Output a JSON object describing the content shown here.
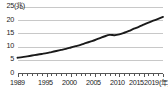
{
  "chart_data": {
    "type": "line",
    "title": "",
    "subtitle": "",
    "xlabel": "年",
    "ylabel": "兆",
    "y_unit_label": "(兆)",
    "x_unit_label": "(年)",
    "xlim": [
      1989,
      2019
    ],
    "ylim": [
      0,
      25
    ],
    "yticks": [
      0,
      5,
      10,
      15,
      20,
      25
    ],
    "ytick_labels": [
      "0",
      "5",
      "10",
      "15",
      "20",
      "25"
    ],
    "xticks": [
      1989,
      1995,
      2000,
      2005,
      2010,
      2015,
      2019
    ],
    "xtick_labels": [
      "1989",
      "1995",
      "2000",
      "2005",
      "2010",
      "2015",
      "2019"
    ],
    "grid": true,
    "grid_axis": "y",
    "legend": false,
    "legend_position": "none",
    "minor_xticks_every": 1,
    "line_color": "#1a1a1a",
    "grid_color": "#c8c8c8",
    "axis_color": "#555555",
    "background_color": "#ffffff",
    "x": [
      1989,
      1990,
      1991,
      1992,
      1993,
      1994,
      1995,
      1996,
      1997,
      1998,
      1999,
      2000,
      2001,
      2002,
      2003,
      2004,
      2005,
      2006,
      2007,
      2008,
      2009,
      2010,
      2011,
      2012,
      2013,
      2014,
      2015,
      2016,
      2017,
      2018,
      2019
    ],
    "values": [
      5.9,
      6.1,
      6.4,
      6.7,
      7.0,
      7.3,
      7.6,
      8.0,
      8.4,
      8.8,
      9.2,
      9.7,
      10.2,
      10.7,
      11.3,
      11.9,
      12.5,
      13.2,
      13.9,
      14.4,
      14.3,
      14.6,
      15.2,
      15.9,
      16.7,
      17.4,
      18.2,
      19.0,
      19.7,
      20.4,
      21.1
    ],
    "annotations": []
  },
  "y_axis": {
    "ticks": [
      {
        "label": "25",
        "value": 25
      },
      {
        "label": "20",
        "value": 20
      },
      {
        "label": "15",
        "value": 15
      },
      {
        "label": "10",
        "value": 10
      },
      {
        "label": "5",
        "value": 5
      },
      {
        "label": "0",
        "value": 0
      }
    ],
    "unit": "(兆)"
  },
  "x_axis": {
    "ticks": [
      {
        "label": "1989",
        "value": 1989
      },
      {
        "label": "1995",
        "value": 1995
      },
      {
        "label": "2000",
        "value": 2000
      },
      {
        "label": "2005",
        "value": 2005
      },
      {
        "label": "2010",
        "value": 2010
      },
      {
        "label": "2015",
        "value": 2015
      },
      {
        "label": "2019",
        "value": 2019
      }
    ],
    "unit": "(年)"
  }
}
